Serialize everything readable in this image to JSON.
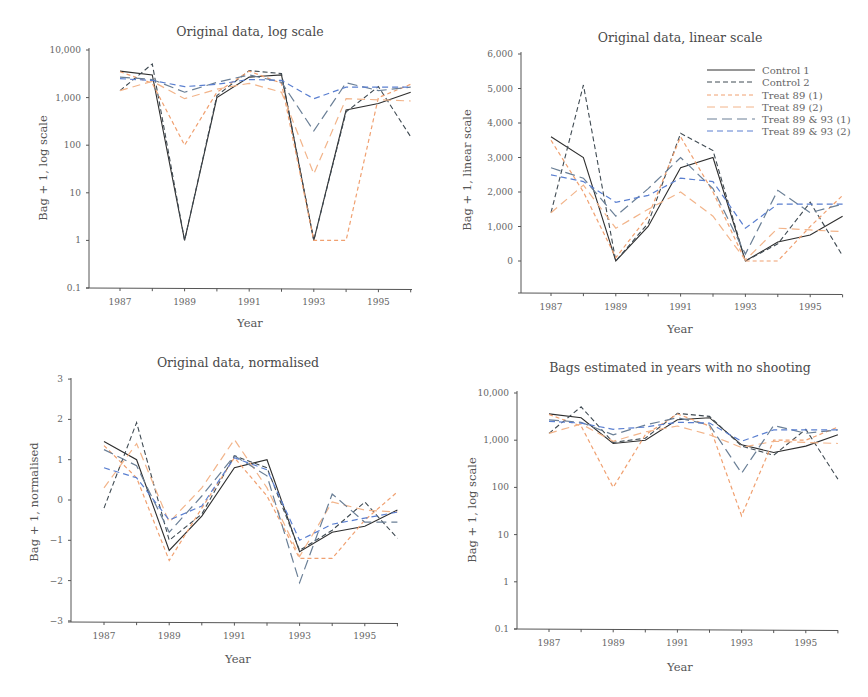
{
  "chart_data": [
    {
      "type": "line",
      "title": "Original data, log scale",
      "xlabel": "Year",
      "ylabel": "Bag + 1, log scale",
      "yscale": "log",
      "ylim": [
        0.1,
        10000
      ],
      "yticks": [
        "0.1",
        "1",
        "10",
        "100",
        "1,000",
        "10,000"
      ],
      "xticks": [
        "1987",
        "1989",
        "1991",
        "1993",
        "1995"
      ],
      "x": [
        1987,
        1988,
        1989,
        1990,
        1991,
        1992,
        1993,
        1994,
        1995,
        1996
      ],
      "grid": false,
      "series": [
        {
          "name": "Control 1",
          "values": [
            3600,
            3000,
            1,
            1000,
            2700,
            3000,
            1,
            550,
            750,
            1300
          ]
        },
        {
          "name": "Control 2",
          "values": [
            1400,
            5100,
            1,
            1100,
            3700,
            3200,
            1,
            500,
            1700,
            150
          ]
        },
        {
          "name": "Treat 89 (1)",
          "values": [
            3500,
            2000,
            100,
            1300,
            3600,
            2000,
            1,
            1,
            1000,
            1900
          ]
        },
        {
          "name": "Treat 89 (2)",
          "values": [
            1400,
            2200,
            950,
            1500,
            2000,
            1300,
            25,
            950,
            900,
            850
          ]
        },
        {
          "name": "Treat 89 & 93 (1)",
          "values": [
            2700,
            2400,
            1300,
            2100,
            3000,
            2100,
            200,
            2050,
            1400,
            1650
          ]
        },
        {
          "name": "Treat 89 & 93 (2)",
          "values": [
            2500,
            2300,
            1700,
            1900,
            2400,
            2300,
            950,
            1650,
            1650,
            1650
          ]
        }
      ]
    },
    {
      "type": "line",
      "title": "Original data, linear scale",
      "xlabel": "Year",
      "ylabel": "Bag + 1, linear scale",
      "yscale": "linear",
      "ylim": [
        -1000,
        6000
      ],
      "yticks": [
        "0",
        "1,000",
        "2,000",
        "3,000",
        "4,000",
        "5,000",
        "6,000"
      ],
      "xticks": [
        "1987",
        "1989",
        "1991",
        "1993",
        "1995"
      ],
      "x": [
        1987,
        1988,
        1989,
        1990,
        1991,
        1992,
        1993,
        1994,
        1995,
        1996
      ],
      "grid": false,
      "legend_position": "upper right",
      "series": [
        {
          "name": "Control 1",
          "values": [
            3600,
            3000,
            0,
            1000,
            2700,
            3000,
            0,
            550,
            750,
            1300
          ]
        },
        {
          "name": "Control 2",
          "values": [
            1400,
            5100,
            0,
            1100,
            3700,
            3200,
            0,
            500,
            1700,
            150
          ]
        },
        {
          "name": "Treat 89 (1)",
          "values": [
            3500,
            2000,
            100,
            1300,
            3600,
            2000,
            0,
            0,
            1000,
            1900
          ]
        },
        {
          "name": "Treat 89 (2)",
          "values": [
            1400,
            2200,
            950,
            1500,
            2000,
            1300,
            25,
            950,
            900,
            850
          ]
        },
        {
          "name": "Treat 89 & 93 (1)",
          "values": [
            2700,
            2400,
            1300,
            2100,
            3000,
            2100,
            200,
            2050,
            1400,
            1650
          ]
        },
        {
          "name": "Treat 89 & 93 (2)",
          "values": [
            2500,
            2300,
            1700,
            1900,
            2400,
            2300,
            950,
            1650,
            1650,
            1650
          ]
        }
      ]
    },
    {
      "type": "line",
      "title": "Original data, normalised",
      "xlabel": "Year",
      "ylabel": "Bag + 1, normalised",
      "yscale": "linear",
      "ylim": [
        -3,
        3
      ],
      "yticks": [
        "−3",
        "−2",
        "−1",
        "0",
        "1",
        "2",
        "3"
      ],
      "xticks": [
        "1987",
        "1989",
        "1991",
        "1993",
        "1995"
      ],
      "x": [
        1987,
        1988,
        1989,
        1990,
        1991,
        1992,
        1993,
        1994,
        1995,
        1996
      ],
      "grid": false,
      "series": [
        {
          "name": "Control 1",
          "values": [
            1.45,
            1.0,
            -1.25,
            -0.4,
            0.8,
            1.0,
            -1.28,
            -0.8,
            -0.65,
            -0.25
          ]
        },
        {
          "name": "Control 2",
          "values": [
            -0.2,
            1.92,
            -1.0,
            -0.35,
            1.1,
            0.8,
            -1.25,
            -0.75,
            -0.05,
            -0.95
          ]
        },
        {
          "name": "Treat 89 (1)",
          "values": [
            1.35,
            0.55,
            -1.5,
            -0.2,
            1.05,
            0.1,
            -1.45,
            -1.45,
            -0.5,
            0.2
          ]
        },
        {
          "name": "Treat 89 (2)",
          "values": [
            0.3,
            1.4,
            -0.55,
            0.3,
            1.5,
            0.3,
            -1.4,
            -0.05,
            -0.25,
            -0.3
          ]
        },
        {
          "name": "Treat 89 & 93 (1)",
          "values": [
            1.25,
            0.85,
            -0.8,
            0.1,
            1.1,
            0.6,
            -2.05,
            0.15,
            -0.55,
            -0.55
          ]
        },
        {
          "name": "Treat 89 & 93 (2)",
          "values": [
            0.8,
            0.55,
            -0.5,
            -0.15,
            1.05,
            0.75,
            -1.0,
            -0.6,
            -0.45,
            -0.3
          ]
        }
      ]
    },
    {
      "type": "line",
      "title": "Bags estimated in years with no shooting",
      "xlabel": "Year",
      "ylabel": "Bag + 1, log scale",
      "yscale": "log",
      "ylim": [
        0.1,
        10000
      ],
      "yticks": [
        "0.1",
        "1",
        "10",
        "100",
        "1,000",
        "10,000"
      ],
      "xticks": [
        "1987",
        "1989",
        "1991",
        "1993",
        "1995"
      ],
      "x": [
        1987,
        1988,
        1989,
        1990,
        1991,
        1992,
        1993,
        1994,
        1995,
        1996
      ],
      "grid": false,
      "series": [
        {
          "name": "Control 1",
          "values": [
            3600,
            3000,
            850,
            1000,
            2700,
            3000,
            800,
            550,
            750,
            1300
          ]
        },
        {
          "name": "Control 2",
          "values": [
            1400,
            5100,
            900,
            1100,
            3700,
            3200,
            750,
            480,
            1700,
            150
          ]
        },
        {
          "name": "Treat 89 (1)",
          "values": [
            3500,
            2000,
            100,
            1300,
            3600,
            2000,
            25,
            1000,
            1000,
            1900
          ]
        },
        {
          "name": "Treat 89 (2)",
          "values": [
            1400,
            2200,
            950,
            1500,
            2000,
            1300,
            700,
            950,
            900,
            850
          ]
        },
        {
          "name": "Treat 89 & 93 (1)",
          "values": [
            2700,
            2400,
            1300,
            2100,
            3000,
            2100,
            200,
            2050,
            1400,
            1650
          ]
        },
        {
          "name": "Treat 89 & 93 (2)",
          "values": [
            2500,
            2300,
            1700,
            1900,
            2400,
            2300,
            950,
            1650,
            1650,
            1650
          ]
        }
      ]
    }
  ],
  "series_styles": [
    {
      "name": "Control 1",
      "color": "#2e2e2e",
      "dash": ""
    },
    {
      "name": "Control 2",
      "color": "#3f4a52",
      "dash": "5,3"
    },
    {
      "name": "Treat 89 (1)",
      "color": "#f0a070",
      "dash": "4,3"
    },
    {
      "name": "Treat 89 (2)",
      "color": "#f2b48a",
      "dash": "8,5"
    },
    {
      "name": "Treat 89 & 93 (1)",
      "color": "#6a7f96",
      "dash": "10,5"
    },
    {
      "name": "Treat 89 & 93 (2)",
      "color": "#5a7fd0",
      "dash": "6,4"
    }
  ],
  "legend": {
    "items": [
      "Control 1",
      "Control 2",
      "Treat 89 (1)",
      "Treat 89 (2)",
      "Treat 89 & 93 (1)",
      "Treat 89 & 93 (2)"
    ]
  },
  "panels": [
    {
      "title": "Original data, log scale",
      "xlabel": "Year",
      "ylabel": "Bag + 1, log scale"
    },
    {
      "title": "Original data, linear scale",
      "xlabel": "Year",
      "ylabel": "Bag + 1, linear scale"
    },
    {
      "title": "Original data, normalised",
      "xlabel": "Year",
      "ylabel": "Bag + 1, normalised"
    },
    {
      "title": "Bags estimated in years with no shooting",
      "xlabel": "Year",
      "ylabel": "Bag + 1, log scale"
    }
  ]
}
